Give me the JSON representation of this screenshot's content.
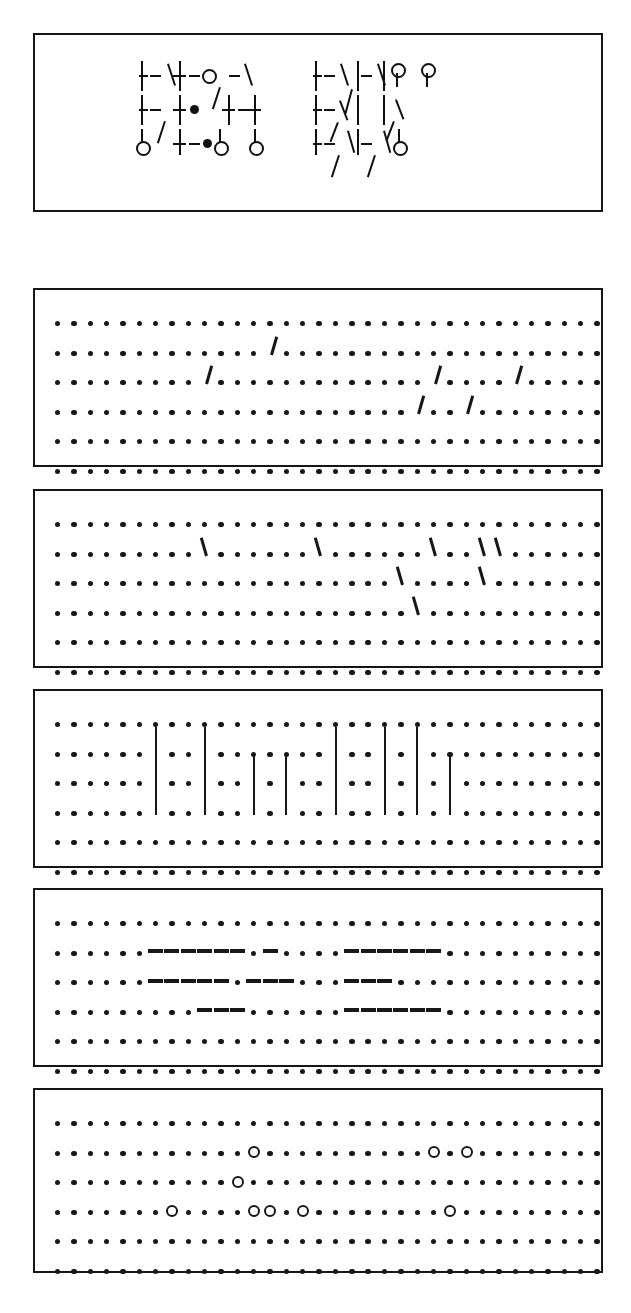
{
  "figure": {
    "title": "",
    "kind": "symbol-pattern-grid-figure",
    "panel_count": 6,
    "ink_color": "#17171b",
    "background_color": "#ffffff",
    "border_color": "#16161a"
  },
  "symbol_panel": {
    "label": "",
    "grid_cols": 9,
    "grid_rows": 3,
    "groups": [
      {
        "name": "left-group",
        "rows": [
          "+-\\+-o/-\\",
          "+-/+o +-+",
          "o  +-oo o"
        ]
      },
      {
        "name": "right-group",
        "rows": [
          "+-\\/-\\o o",
          "+-x | | x",
          "+-/+-/ o"
        ]
      }
    ],
    "legend": {
      "plus": "cross-junction",
      "circle": "node-ring",
      "dot": "filled-node",
      "slash": "forward-slash-stroke",
      "backslash": "back-slash-stroke",
      "x": "x-crossing",
      "vbar": "vertical-stroke",
      "dash": "horizontal-stroke"
    }
  },
  "grid_panels": [
    {
      "name": "forward-slash-panel",
      "glyph": "/",
      "glyph_semantic": "forward-slash",
      "cols": 34,
      "rows": 6,
      "marks": [
        {
          "row": 1,
          "cols": [
            13
          ]
        },
        {
          "row": 2,
          "cols": [
            9,
            23,
            28
          ]
        },
        {
          "row": 3,
          "cols": [
            22,
            25
          ]
        }
      ]
    },
    {
      "name": "back-slash-panel",
      "glyph": "\\",
      "glyph_semantic": "back-slash",
      "cols": 34,
      "rows": 6,
      "marks": [
        {
          "row": 1,
          "cols": [
            9,
            16,
            23,
            26,
            27
          ]
        },
        {
          "row": 2,
          "cols": [
            21,
            26
          ]
        },
        {
          "row": 3,
          "cols": [
            22
          ]
        }
      ]
    },
    {
      "name": "vertical-bar-panel",
      "glyph": "|",
      "glyph_semantic": "vertical-bar",
      "cols": 34,
      "rows": 6,
      "marks": [
        {
          "row": 1,
          "cols": [
            6,
            9,
            17,
            20,
            22
          ]
        },
        {
          "row": 2,
          "cols": [
            6,
            9,
            12,
            14,
            17,
            20,
            22,
            24
          ]
        },
        {
          "row": 3,
          "cols": [
            6,
            9,
            12,
            14,
            17,
            20,
            22,
            24
          ]
        }
      ]
    },
    {
      "name": "horizontal-dash-panel",
      "glyph": "-",
      "glyph_semantic": "horizontal-dash",
      "cols": 34,
      "rows": 6,
      "marks": [
        {
          "row": 1,
          "cols": [
            6,
            7,
            8,
            9,
            10,
            11,
            13,
            18,
            19,
            20,
            21,
            22,
            23
          ]
        },
        {
          "row": 2,
          "cols": [
            6,
            7,
            8,
            9,
            10,
            12,
            13,
            14,
            18,
            19,
            20
          ]
        },
        {
          "row": 3,
          "cols": [
            9,
            10,
            11,
            18,
            19,
            20,
            21,
            22,
            23
          ]
        }
      ]
    },
    {
      "name": "open-circle-panel",
      "glyph": "o",
      "glyph_semantic": "open-circle",
      "cols": 34,
      "rows": 6,
      "marks": [
        {
          "row": 1,
          "cols": [
            12
          ]
        },
        {
          "row": 1,
          "cols": [
            23,
            25
          ]
        },
        {
          "row": 2,
          "cols": [
            11
          ]
        },
        {
          "row": 3,
          "cols": [
            7,
            12,
            13,
            15,
            24
          ]
        }
      ]
    }
  ]
}
